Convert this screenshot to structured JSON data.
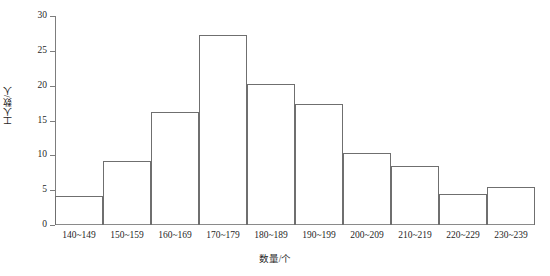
{
  "chart_data": {
    "type": "bar",
    "title": "",
    "subtitle": "",
    "xlabel": "数量/个",
    "ylabel": "工人数/人",
    "categories": [
      "140~149",
      "150~159",
      "160~169",
      "170~179",
      "180~189",
      "190~199",
      "200~209",
      "210~219",
      "220~229",
      "230~239"
    ],
    "values": [
      4.2,
      9.2,
      16.2,
      27.3,
      20.3,
      17.3,
      10.3,
      8.4,
      4.4,
      5.5
    ],
    "ylim": [
      0,
      30
    ],
    "yticks": [
      "0",
      "5",
      "10",
      "15",
      "20",
      "25",
      "30"
    ],
    "ytick_values": [
      0,
      5,
      10,
      15,
      20,
      25,
      30
    ],
    "grid": false,
    "legend": "none",
    "bar_style": {
      "fill": "none",
      "edge_color": "#6f6f6f",
      "gap": 0
    },
    "axis_color": "#7d7d7d"
  }
}
